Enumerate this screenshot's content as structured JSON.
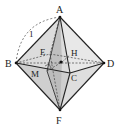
{
  "figure": {
    "vertices": {
      "A": {
        "label": "A",
        "x": 60,
        "y": 17
      },
      "B": {
        "label": "B",
        "x": 16,
        "y": 63
      },
      "C": {
        "label": "C",
        "x": 70,
        "y": 73
      },
      "D": {
        "label": "D",
        "x": 104,
        "y": 63
      },
      "E": {
        "label": "E",
        "x": 50,
        "y": 54
      },
      "F": {
        "label": "F",
        "x": 60,
        "y": 110
      },
      "H": {
        "label": "H",
        "x": 66,
        "y": 55
      },
      "M": {
        "label": "M",
        "x": 47,
        "y": 71
      }
    },
    "edge_length_label": "1",
    "colors": {
      "face_light": "#e6e6e6",
      "face_mid": "#d2d2d2",
      "face_dark": "#b8b8b8",
      "edge": "#222222",
      "dashed": "#444444"
    }
  }
}
